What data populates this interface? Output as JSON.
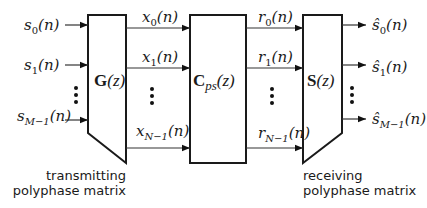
{
  "diagram": {
    "blocks": {
      "transmitter": {
        "symbol": "G",
        "arg": "(z)"
      },
      "channel": {
        "symbol": "C",
        "subscript": "ps",
        "arg": "(z)"
      },
      "receiver": {
        "symbol": "S",
        "arg": "(z)"
      }
    },
    "inputs": [
      {
        "var": "s",
        "sub": "0",
        "arg": "(n)"
      },
      {
        "var": "s",
        "sub": "1",
        "arg": "(n)"
      },
      {
        "var": "s",
        "sub": "M−1",
        "arg": "(n)"
      }
    ],
    "tx_outputs": [
      {
        "var": "x",
        "sub": "0",
        "arg": "(n)"
      },
      {
        "var": "x",
        "sub": "1",
        "arg": "(n)"
      },
      {
        "var": "x",
        "sub": "N−1",
        "arg": "(n)"
      }
    ],
    "channel_outputs": [
      {
        "var": "r",
        "sub": "0",
        "arg": "(n)"
      },
      {
        "var": "r",
        "sub": "1",
        "arg": "(n)"
      },
      {
        "var": "r",
        "sub": "N−1",
        "arg": "(n)"
      }
    ],
    "outputs": [
      {
        "var": "ŝ",
        "sub": "0",
        "arg": "(n)"
      },
      {
        "var": "ŝ",
        "sub": "1",
        "arg": "(n)"
      },
      {
        "var": "ŝ",
        "sub": "M−1",
        "arg": "(n)"
      }
    ],
    "ellipsis_icon": "vertical-ellipsis",
    "captions": {
      "transmitter_line1": "transmitting",
      "transmitter_line2": "polyphase matrix",
      "receiver_line1": "receiving",
      "receiver_line2": "polyphase matrix"
    }
  }
}
